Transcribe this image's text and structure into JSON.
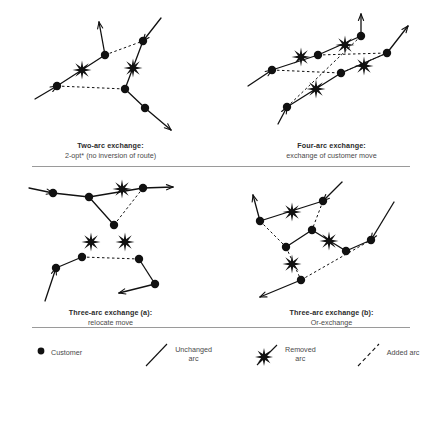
{
  "figure": {
    "background": "#ffffff",
    "ink": "#111111",
    "divider_color": "#9a9a9a"
  },
  "panels": [
    {
      "id": "two-arc-exchange",
      "caption_title": "Two-arc exchange:",
      "caption_sub": "2-opt* (no inversion of route)",
      "nodes": [
        {
          "id": "n1",
          "x": 36,
          "y": 86
        },
        {
          "id": "n2",
          "x": 84,
          "y": 55
        },
        {
          "id": "n3",
          "x": 122,
          "y": 41
        },
        {
          "id": "n4",
          "x": 104,
          "y": 89
        },
        {
          "id": "n5",
          "x": 124,
          "y": 108
        }
      ],
      "solid_arcs": [
        {
          "from": [
            14,
            99
          ],
          "to": [
            36,
            86
          ],
          "arrow": "end"
        },
        {
          "from": [
            36,
            86
          ],
          "to": [
            84,
            55
          ],
          "arrow": "none"
        },
        {
          "from": [
            84,
            55
          ],
          "to": [
            78,
            22
          ],
          "arrow": "end"
        },
        {
          "from": [
            140,
            18
          ],
          "to": [
            122,
            41
          ],
          "arrow": "end"
        },
        {
          "from": [
            122,
            41
          ],
          "to": [
            104,
            89
          ],
          "arrow": "none"
        },
        {
          "from": [
            104,
            89
          ],
          "to": [
            124,
            108
          ],
          "arrow": "none"
        },
        {
          "from": [
            124,
            108
          ],
          "to": [
            150,
            130
          ],
          "arrow": "end"
        }
      ],
      "dotted_arcs": [
        {
          "from": [
            84,
            55
          ],
          "to": [
            122,
            41
          ]
        },
        {
          "from": [
            36,
            86
          ],
          "to": [
            104,
            89
          ]
        }
      ],
      "stars": [
        {
          "x": 61,
          "y": 70
        },
        {
          "x": 112,
          "y": 68
        }
      ]
    },
    {
      "id": "four-arc-exchange",
      "caption_title": "Four-arc exchange:",
      "caption_sub": "exchange of customer move",
      "nodes": [
        {
          "id": "m1",
          "x": 30,
          "y": 70
        },
        {
          "id": "m2",
          "x": 76,
          "y": 55
        },
        {
          "id": "m3",
          "x": 119,
          "y": 36
        },
        {
          "id": "m4",
          "x": 145,
          "y": 53
        },
        {
          "id": "m5",
          "x": 99,
          "y": 73
        },
        {
          "id": "m6",
          "x": 45,
          "y": 107
        }
      ],
      "solid_arcs": [
        {
          "from": [
            6,
            86
          ],
          "to": [
            30,
            70
          ],
          "arrow": "end"
        },
        {
          "from": [
            30,
            70
          ],
          "to": [
            76,
            55
          ],
          "arrow": "none"
        },
        {
          "from": [
            76,
            55
          ],
          "to": [
            119,
            36
          ],
          "arrow": "none"
        },
        {
          "from": [
            119,
            36
          ],
          "to": [
            119,
            14
          ],
          "arrow": "end"
        },
        {
          "from": [
            36,
            124
          ],
          "to": [
            45,
            107
          ],
          "arrow": "end"
        },
        {
          "from": [
            45,
            107
          ],
          "to": [
            99,
            73
          ],
          "arrow": "none"
        },
        {
          "from": [
            99,
            73
          ],
          "to": [
            145,
            53
          ],
          "arrow": "none"
        },
        {
          "from": [
            145,
            53
          ],
          "to": [
            166,
            26
          ],
          "arrow": "end"
        }
      ],
      "dotted_arcs": [
        {
          "from": [
            30,
            70
          ],
          "to": [
            99,
            73
          ]
        },
        {
          "from": [
            99,
            73
          ],
          "to": [
            145,
            53
          ]
        },
        {
          "from": [
            76,
            55
          ],
          "to": [
            145,
            53
          ]
        },
        {
          "from": [
            45,
            107
          ],
          "to": [
            119,
            36
          ]
        }
      ],
      "stars": [
        {
          "x": 59,
          "y": 57
        },
        {
          "x": 103,
          "y": 45
        },
        {
          "x": 122,
          "y": 66
        },
        {
          "x": 74,
          "y": 89
        }
      ]
    },
    {
      "id": "three-arc-exchange-a",
      "caption_title": "Three-arc exchange (a):",
      "caption_sub": "relocate move",
      "nodes": [
        {
          "id": "p1",
          "x": 32,
          "y": 26
        },
        {
          "id": "p2",
          "x": 68,
          "y": 30
        },
        {
          "id": "p3",
          "x": 122,
          "y": 21
        },
        {
          "id": "p4",
          "x": 93,
          "y": 58
        },
        {
          "id": "p5",
          "x": 61,
          "y": 90
        },
        {
          "id": "p6",
          "x": 118,
          "y": 92
        },
        {
          "id": "p7",
          "x": 35,
          "y": 101
        },
        {
          "id": "p8",
          "x": 134,
          "y": 117
        }
      ],
      "solid_arcs": [
        {
          "from": [
            8,
            21
          ],
          "to": [
            32,
            26
          ],
          "arrow": "end"
        },
        {
          "from": [
            32,
            26
          ],
          "to": [
            68,
            30
          ],
          "arrow": "none"
        },
        {
          "from": [
            68,
            30
          ],
          "to": [
            122,
            21
          ],
          "arrow": "none"
        },
        {
          "from": [
            122,
            21
          ],
          "to": [
            152,
            20
          ],
          "arrow": "end"
        },
        {
          "from": [
            68,
            30
          ],
          "to": [
            93,
            58
          ],
          "arrow": "none"
        },
        {
          "from": [
            24,
            134
          ],
          "to": [
            35,
            101
          ],
          "arrow": "end"
        },
        {
          "from": [
            35,
            101
          ],
          "to": [
            61,
            90
          ],
          "arrow": "none"
        },
        {
          "from": [
            118,
            92
          ],
          "to": [
            134,
            117
          ],
          "arrow": "none"
        },
        {
          "from": [
            134,
            117
          ],
          "to": [
            98,
            126
          ],
          "arrow": "end"
        }
      ],
      "dotted_arcs": [
        {
          "from": [
            93,
            58
          ],
          "to": [
            122,
            21
          ]
        },
        {
          "from": [
            61,
            90
          ],
          "to": [
            118,
            92
          ]
        }
      ],
      "stars": [
        {
          "x": 101,
          "y": 22
        },
        {
          "x": 70,
          "y": 75
        },
        {
          "x": 104,
          "y": 75
        }
      ]
    },
    {
      "id": "three-arc-exchange-b",
      "caption_title": "Three-arc exchange (b):",
      "caption_sub": "Or-exchange",
      "nodes": [
        {
          "id": "q1",
          "x": 18,
          "y": 54
        },
        {
          "id": "q2",
          "x": 81,
          "y": 34
        },
        {
          "id": "q3",
          "x": 70,
          "y": 63
        },
        {
          "id": "q4",
          "x": 44,
          "y": 80
        },
        {
          "id": "q5",
          "x": 59,
          "y": 113
        },
        {
          "id": "q6",
          "x": 104,
          "y": 84
        },
        {
          "id": "q7",
          "x": 129,
          "y": 73
        }
      ],
      "solid_arcs": [
        {
          "from": [
            18,
            54
          ],
          "to": [
            11,
            28
          ],
          "arrow": "end"
        },
        {
          "from": [
            18,
            54
          ],
          "to": [
            81,
            34
          ],
          "arrow": "none"
        },
        {
          "from": [
            81,
            34
          ],
          "to": [
            100,
            15
          ],
          "arrow": "start"
        },
        {
          "from": [
            70,
            63
          ],
          "to": [
            104,
            84
          ],
          "arrow": "none"
        },
        {
          "from": [
            104,
            84
          ],
          "to": [
            129,
            73
          ],
          "arrow": "none"
        },
        {
          "from": [
            129,
            73
          ],
          "to": [
            152,
            35
          ],
          "arrow": "start"
        },
        {
          "from": [
            44,
            80
          ],
          "to": [
            70,
            63
          ],
          "arrow": "none"
        },
        {
          "from": [
            59,
            113
          ],
          "to": [
            18,
            130
          ],
          "arrow": "end"
        }
      ],
      "dotted_arcs": [
        {
          "from": [
            18,
            54
          ],
          "to": [
            44,
            80
          ]
        },
        {
          "from": [
            81,
            34
          ],
          "to": [
            70,
            63
          ]
        },
        {
          "from": [
            44,
            80
          ],
          "to": [
            59,
            113
          ]
        },
        {
          "from": [
            59,
            113
          ],
          "to": [
            129,
            73
          ]
        }
      ],
      "stars": [
        {
          "x": 50,
          "y": 45
        },
        {
          "x": 87,
          "y": 74
        },
        {
          "x": 50,
          "y": 97
        }
      ]
    }
  ],
  "legend": {
    "items": [
      {
        "id": "customer",
        "icon": "filled-circle-icon",
        "label": "Customer"
      },
      {
        "id": "unchanged-arc",
        "icon": "solid-line-icon",
        "label": "Unchanged\narc"
      },
      {
        "id": "removed-arc",
        "icon": "starburst-line-icon",
        "label": "Removed\narc"
      },
      {
        "id": "added-arc",
        "icon": "dashed-line-icon",
        "label": "Added arc"
      }
    ]
  }
}
